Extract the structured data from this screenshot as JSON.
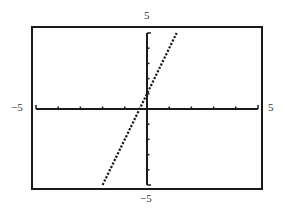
{
  "chart_data": {
    "type": "line",
    "title": "",
    "xlabel": "",
    "ylabel": "",
    "xlim": [
      -5,
      5
    ],
    "ylim": [
      -5,
      5
    ],
    "grid": false,
    "legend": null,
    "x_tick_step": 1,
    "y_tick_step": 1,
    "axis_labels": {
      "x_min": "−5",
      "x_max": "5",
      "y_min": "−5",
      "y_max": "5"
    },
    "series": [
      {
        "name": "y = 3x + 1",
        "equation": "y = 3x + 1",
        "style": "dotted",
        "x": [
          -2,
          1.333
        ],
        "y": [
          -5,
          5
        ]
      }
    ],
    "colors": {
      "frame": "#1a1a1a",
      "axes": "#1a1a1a",
      "line": "#1a1a1a",
      "background": "#ffffff"
    }
  }
}
